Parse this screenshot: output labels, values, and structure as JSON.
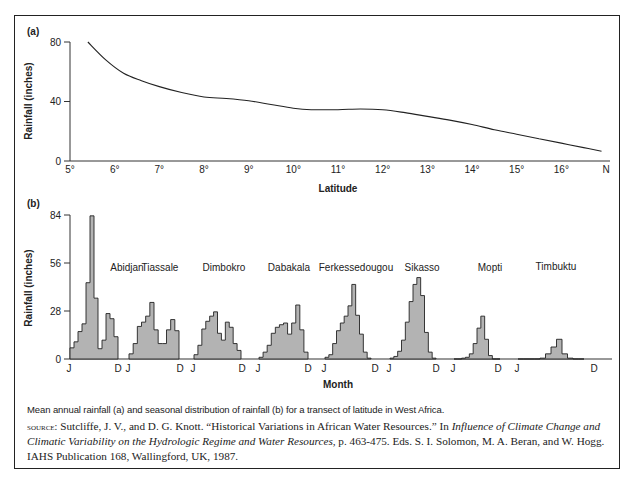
{
  "caption": "Mean annual rainfall (a) and seasonal distribution of rainfall (b) for a transect of latitude in West Africa.",
  "source": {
    "label": "source:",
    "text_1": " Sutcliffe, J. V., and D. G. Knott. “Historical Variations in African Water Resources.” In ",
    "italic": "Influence of Climate Change and Climatic Variability on the Hydrologic Regime and Water Resources",
    "text_2": ", p. 463-475. Eds. S. I. Solomon, M. A. Beran, and W. Hogg. IAHS Publication 168, Wallingford, UK, 1987."
  },
  "chart_data": [
    {
      "panel": "(a)",
      "type": "line",
      "title": "",
      "xlabel": "Latitude",
      "ylabel": "Rainfall (inches)",
      "x_tick_labels": [
        "5°",
        "6°",
        "7°",
        "8°",
        "9°",
        "10°",
        "11°",
        "12°",
        "13°",
        "14°",
        "15°",
        "16°",
        "N"
      ],
      "y_ticks": [
        0,
        40,
        80
      ],
      "ylim": [
        0,
        80
      ],
      "xlim": [
        5,
        17
      ],
      "grid": false,
      "x": [
        5.4,
        5.8,
        6.2,
        6.6,
        7.0,
        7.5,
        8.0,
        8.5,
        9.0,
        9.5,
        10.0,
        10.4,
        11.0,
        11.5,
        12.0,
        12.5,
        13.0,
        13.5,
        14.0,
        14.5,
        15.0,
        15.5,
        16.0,
        16.5,
        16.9
      ],
      "values": [
        80,
        68,
        59,
        54,
        50,
        46,
        43,
        42,
        40.5,
        38,
        35.5,
        34.5,
        34.5,
        35,
        34.5,
        32.5,
        30,
        27.5,
        24.5,
        21,
        18,
        15,
        12,
        9,
        6.5
      ],
      "color": "#222222"
    },
    {
      "panel": "(b)",
      "type": "bar",
      "title": "",
      "xlabel": "Month",
      "ylabel": "Rainfall (inches)",
      "y_ticks": [
        0,
        28,
        56,
        84
      ],
      "ylim": [
        0,
        84
      ],
      "grid": false,
      "month_range_labels": [
        "J",
        "D"
      ],
      "bar_fill": "#b3b3b3",
      "bar_stroke": "#222222",
      "categories": [
        "J",
        "F",
        "M",
        "A",
        "M",
        "J",
        "J",
        "A",
        "S",
        "O",
        "N",
        "D"
      ],
      "series": [
        {
          "name": "Abidjan",
          "values": [
            6.5,
            10,
            16,
            20.5,
            44.5,
            83.5,
            35.5,
            6,
            11,
            26.5,
            23.5,
            13
          ]
        },
        {
          "name": "Tiassale",
          "values": [
            3,
            9,
            19,
            21.5,
            25,
            33,
            17,
            9,
            9,
            17,
            23,
            16.5
          ]
        },
        {
          "name": "Dimbokro",
          "values": [
            2.5,
            8,
            17.5,
            22,
            25,
            27.5,
            15,
            11,
            21.5,
            18.5,
            9,
            5
          ]
        },
        {
          "name": "Dabakala",
          "values": [
            1,
            4,
            8,
            15,
            18.5,
            20,
            21,
            14.5,
            21,
            31.5,
            17,
            4
          ]
        },
        {
          "name": "Ferkessedougou",
          "values": [
            1,
            2.5,
            9,
            16.5,
            21,
            25,
            31,
            43.5,
            25.5,
            14.5,
            4,
            0.5
          ]
        },
        {
          "name": "Sikasso",
          "values": [
            0.5,
            1.5,
            4.5,
            11,
            21.5,
            33.5,
            43.5,
            47.5,
            37,
            15.5,
            4,
            0.5
          ]
        },
        {
          "name": "Mopti",
          "values": [
            0,
            0,
            0.5,
            1,
            3,
            9,
            18,
            25,
            11.5,
            2,
            0,
            0
          ]
        },
        {
          "name": "Timbuktu",
          "values": [
            0,
            0,
            0,
            0,
            0.5,
            3,
            7,
            11.5,
            3,
            0.5,
            0,
            0
          ]
        }
      ]
    }
  ]
}
